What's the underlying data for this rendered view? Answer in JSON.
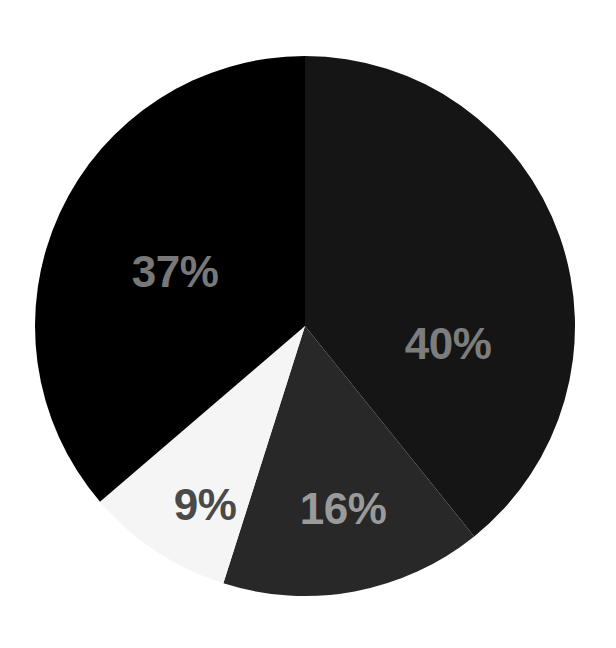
{
  "background_color": "#ffffff",
  "chart_data": {
    "type": "pie",
    "title": "",
    "subtitle": "",
    "xlabel": "",
    "ylabel": "",
    "legend_position": "none",
    "grid": false,
    "labels_shown_on_slices": true,
    "total": 102,
    "units": "%",
    "center": {
      "x": 305,
      "y": 326
    },
    "radius": 270,
    "start_angle_deg": 0,
    "direction": "clockwise",
    "categories": [
      "40%",
      "16%",
      "9%",
      "37%"
    ],
    "values": [
      40,
      16,
      9,
      37
    ],
    "slices": [
      {
        "label": "40%",
        "value": 40,
        "color": "#151515",
        "text_color": "#7d7d7d",
        "start_angle_deg": 0,
        "end_angle_deg": 141.2
      },
      {
        "label": "16%",
        "value": 16,
        "color": "#282828",
        "text_color": "#9a9a9a",
        "start_angle_deg": 141.2,
        "end_angle_deg": 197.6
      },
      {
        "label": "9%",
        "value": 9,
        "color": "#f5f5f5",
        "text_color": "#4a4a4a",
        "start_angle_deg": 197.6,
        "end_angle_deg": 229.4
      },
      {
        "label": "37%",
        "value": 37,
        "color": "#000000",
        "text_color": "#787878",
        "start_angle_deg": 229.4,
        "end_angle_deg": 360
      }
    ]
  },
  "labels": {
    "forty": "40%",
    "thirtyseven": "37%",
    "sixteen": "16%",
    "nine": "9%"
  }
}
